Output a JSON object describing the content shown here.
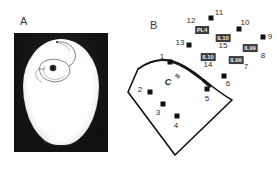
{
  "figure": {
    "panels": [
      {
        "id": "A",
        "letter": "A",
        "x": 20,
        "y": 16,
        "kind": "radiograph"
      },
      {
        "id": "B",
        "letter": "B",
        "x": 24,
        "y": 20,
        "kind": "schematic"
      }
    ]
  },
  "panel_a": {
    "letter": "A",
    "caption": "",
    "image_name": "skull-radiograph",
    "overlay_name": "implanted-electrode-array"
  },
  "panel_b": {
    "letter": "B",
    "sulcus_marker": {
      "label": "C",
      "x": 42,
      "y": 82
    },
    "craniotomy_outline": "12,69 22,63 36,60 49,60 62,66 76,76 89,88 106,100 49,155 2,92",
    "contacts": [
      {
        "id": 1,
        "label": "1",
        "x": 44,
        "y": 62,
        "label_x": 36,
        "label_y": 57,
        "tag": null
      },
      {
        "id": 2,
        "label": "2",
        "x": 24,
        "y": 92,
        "label_x": 14,
        "label_y": 90,
        "tag": null
      },
      {
        "id": 3,
        "label": "3",
        "x": 37,
        "y": 104,
        "label_x": 32,
        "label_y": 113,
        "tag": null
      },
      {
        "id": 4,
        "label": "4",
        "x": 51,
        "y": 116,
        "label_x": 50,
        "label_y": 126,
        "tag": null
      },
      {
        "id": 5,
        "label": "5",
        "x": 81,
        "y": 89,
        "label_x": 81,
        "label_y": 99,
        "tag": null
      },
      {
        "id": 6,
        "label": "6",
        "x": 98,
        "y": 76,
        "label_x": 102,
        "label_y": 84,
        "tag": null
      },
      {
        "id": 7,
        "label": "7",
        "x": 112,
        "y": 60,
        "label_x": 120,
        "label_y": 67,
        "tag": "IL99"
      },
      {
        "id": 8,
        "label": "8",
        "x": 128,
        "y": 48,
        "label_x": 137,
        "label_y": 56,
        "tag": "IL99"
      },
      {
        "id": 9,
        "label": "9",
        "x": 137,
        "y": 37,
        "label_x": 144,
        "label_y": 37,
        "tag": null
      },
      {
        "id": 10,
        "label": "10",
        "x": 113,
        "y": 29,
        "label_x": 119,
        "label_y": 23,
        "tag": null
      },
      {
        "id": 11,
        "label": "11",
        "x": 85,
        "y": 18,
        "label_x": 93,
        "label_y": 13,
        "tag": null
      },
      {
        "id": 12,
        "label": "12",
        "x": 76,
        "y": 29,
        "label_x": 65,
        "label_y": 21,
        "tag": "PL4"
      },
      {
        "id": 13,
        "label": "13",
        "x": 63,
        "y": 45,
        "label_x": 54,
        "label_y": 43,
        "tag": null
      },
      {
        "id": 14,
        "label": "14",
        "x": 82,
        "y": 57,
        "label_x": 82,
        "label_y": 65,
        "tag": "IL10"
      },
      {
        "id": 15,
        "label": "15",
        "x": 97,
        "y": 38,
        "label_x": 97,
        "label_y": 46,
        "tag": "IL10"
      }
    ],
    "tags": [
      {
        "text": "PL4",
        "x": 76,
        "y": 30
      },
      {
        "text": "IL10",
        "x": 97,
        "y": 38
      },
      {
        "text": "IL10",
        "x": 82,
        "y": 57
      },
      {
        "text": "IL99",
        "x": 124,
        "y": 48
      },
      {
        "text": "IL99",
        "x": 110,
        "y": 60
      }
    ]
  },
  "colors": {
    "ink": "#111111",
    "text": "#2b2b2b",
    "tag_bg": "#3c3c3c",
    "tag_fg": "#e9e9e9",
    "xray_bg": "#0a0a0a",
    "bone": "#ffffff"
  }
}
